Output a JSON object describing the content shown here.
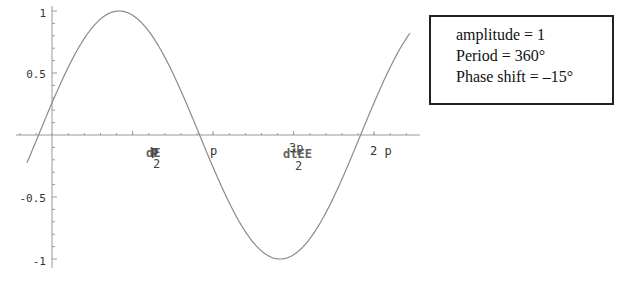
{
  "chart_data": {
    "type": "line",
    "title": "",
    "xlabel": "",
    "ylabel": "",
    "function": "y = sin(x + 15°)",
    "x_units": "radians (tick labels rendered with 'p' for π)",
    "xlim": [
      -0.3,
      7.45
    ],
    "ylim": [
      -1,
      1
    ],
    "grid": false,
    "y_ticks": [
      {
        "value": 1,
        "label": "1"
      },
      {
        "value": 0.5,
        "label": "0.5"
      },
      {
        "value": -0.5,
        "label": "-0.5"
      },
      {
        "value": -1,
        "label": "-1"
      }
    ],
    "x_ticks": [
      {
        "value": 1.5708,
        "label": "p/2 (garbled glyphs)"
      },
      {
        "value": 3.1416,
        "label": "p"
      },
      {
        "value": 4.7124,
        "label": "3p/2 (garbled glyphs)"
      },
      {
        "value": 6.2832,
        "label": "2p"
      }
    ],
    "series": [
      {
        "name": "sin(x + 15°)",
        "amplitude": 1,
        "period_deg": 360,
        "phase_shift_deg": -15,
        "points": [
          {
            "x_deg": -15,
            "y": 0
          },
          {
            "x_deg": 0,
            "y": 0.26
          },
          {
            "x_deg": 75,
            "y": 1
          },
          {
            "x_deg": 165,
            "y": 0
          },
          {
            "x_deg": 255,
            "y": -1
          },
          {
            "x_deg": 345,
            "y": 0
          },
          {
            "x_deg": 360,
            "y": 0.26
          }
        ]
      }
    ],
    "annotations": [
      "amplitude = 1",
      "Period = 360°",
      "Phase shift = –15°"
    ]
  },
  "axis_labels": {
    "y": [
      "1",
      "0.5",
      "-0.5",
      "-1"
    ],
    "x_pi": "p",
    "x_2pi": "2 p",
    "x_half_pi_num": "p",
    "x_half_pi_den": "2",
    "x_half_pi_garble": "dE",
    "x_3half_pi_num": "3p",
    "x_3half_pi_den": "2",
    "x_3half_pi_garble": "dtEE"
  },
  "info_box": {
    "line1": "amplitude = 1",
    "line2": "Period = 360°",
    "line3": "Phase shift = –15°"
  },
  "colors": {
    "curve": "#8a8a8a",
    "axis": "#9a9a9a",
    "text": "#222222"
  }
}
